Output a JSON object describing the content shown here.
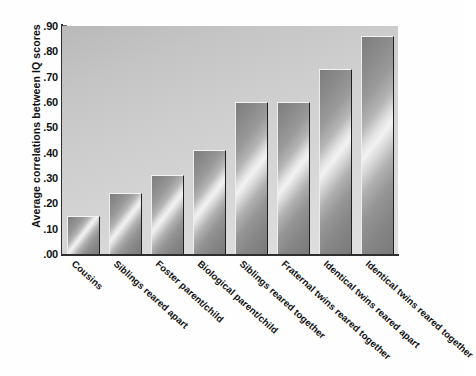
{
  "chart_data": {
    "type": "bar",
    "title": "",
    "xlabel": "",
    "ylabel": "Average correlations between IQ scores",
    "ylim": [
      0.0,
      0.9
    ],
    "grid": false,
    "legend": null,
    "ytick_labels": [
      ".00",
      ".10",
      ".20",
      ".30",
      ".40",
      ".50",
      ".60",
      ".70",
      ".80",
      ".90"
    ],
    "ytick_values": [
      0.0,
      0.1,
      0.2,
      0.3,
      0.4,
      0.5,
      0.6,
      0.7,
      0.8,
      0.9
    ],
    "categories": [
      "Cousins",
      "Siblings reared apart",
      "Foster parent/child",
      "Biological parent/child",
      "Siblings reared together",
      "Fraternal twins reared together",
      "Identical twins reared apart",
      "Identical twins reared together"
    ],
    "values": [
      0.15,
      0.24,
      0.31,
      0.41,
      0.6,
      0.6,
      0.73,
      0.86
    ],
    "colors": {
      "bar_face": "#9a9a9a",
      "bar_highlight": "#f2f2f2",
      "bar_edge_dark": "#1f1f1f",
      "plot_background": "#cfcfcf",
      "axis": "#2e2e2e",
      "text": "#111111"
    }
  }
}
